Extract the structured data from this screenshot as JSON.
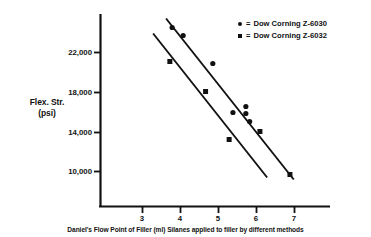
{
  "chart_data": {
    "type": "scatter",
    "title": "",
    "xlabel": "Daniel's Flow Point of Filler (ml) Silanes applied to filler by different methods",
    "ylabel": "Flex. Str. (psi)",
    "ylabel_line1": "Flex. Str.",
    "ylabel_line2": "(psi)",
    "xlim": [
      2.4,
      7.6
    ],
    "ylim": [
      6500,
      25500
    ],
    "xticks": [
      3,
      4,
      5,
      6,
      7
    ],
    "xtick_labels": [
      "3",
      "4",
      "5",
      "6",
      "7"
    ],
    "yticks": [
      10000,
      14000,
      18000,
      22000
    ],
    "ytick_labels": [
      "10,000",
      "14,000",
      "18,000",
      "22,000"
    ],
    "grid": false,
    "legend_position": "top-right",
    "series": [
      {
        "name": "Dow Corning Z-6030",
        "marker": "circle",
        "color": "#111111",
        "points": [
          {
            "x": 3.78,
            "y": 24500
          },
          {
            "x": 4.07,
            "y": 23700
          },
          {
            "x": 4.85,
            "y": 20900
          },
          {
            "x": 5.38,
            "y": 16000
          },
          {
            "x": 5.72,
            "y": 16600
          },
          {
            "x": 5.72,
            "y": 15900
          },
          {
            "x": 5.82,
            "y": 15100
          }
        ],
        "fit_line": {
          "x1": 3.62,
          "y1": 25400,
          "x2": 6.98,
          "y2": 9300
        }
      },
      {
        "name": "Dow Corning Z-6032",
        "marker": "square",
        "color": "#111111",
        "points": [
          {
            "x": 3.72,
            "y": 21100
          },
          {
            "x": 4.66,
            "y": 18100
          },
          {
            "x": 5.28,
            "y": 13300
          },
          {
            "x": 6.09,
            "y": 14100
          },
          {
            "x": 6.88,
            "y": 9800
          }
        ],
        "fit_line": {
          "x1": 3.28,
          "y1": 23900,
          "x2": 6.28,
          "y2": 9500
        }
      }
    ]
  },
  "legend": {
    "entries": [
      {
        "marker": "circle",
        "equals": "=",
        "label": "Dow Corning Z-6030"
      },
      {
        "marker": "square",
        "equals": "=",
        "label": "Dow Corning Z-6032"
      }
    ]
  },
  "axes": {
    "y_label_line1": "Flex. Str.",
    "y_label_line2": "(psi)",
    "x_caption": "Daniel's Flow Point of Filler (ml) Silanes applied to filler by different methods",
    "ytick_labels": [
      "22,000",
      "18,000",
      "14,000",
      "10,000"
    ],
    "xtick_labels": [
      "3",
      "4",
      "5",
      "6",
      "7"
    ]
  },
  "colors": {
    "ink": "#111111",
    "background": "#ffffff"
  }
}
